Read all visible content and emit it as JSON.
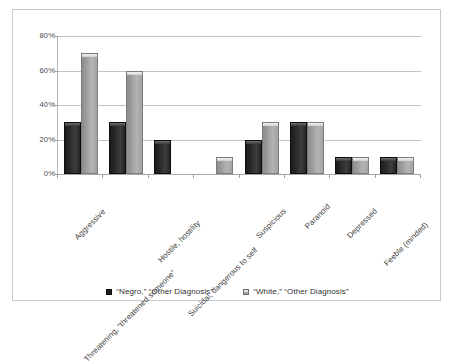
{
  "chart_data": {
    "type": "bar",
    "title": "",
    "subtitle": "",
    "xlabel": "",
    "ylabel": "",
    "ylim": [
      0,
      80
    ],
    "y_tick_labels": [
      "0%",
      "20%",
      "40%",
      "60%",
      "80%"
    ],
    "y_tick_values": [
      0,
      20,
      40,
      60,
      80
    ],
    "grid": true,
    "legend_position": "bottom",
    "categories": [
      "Aggressive",
      "Threatening, “threatened someone”",
      "Hostile, hostility",
      "Suicidal, dangerous to self",
      "Suspicious",
      "Paranoid",
      "Depressed",
      "Feeble (minded)"
    ],
    "series": [
      {
        "name": "“Negro,” “Other Diagnosis”",
        "color": "#1f1f1f",
        "values": [
          30,
          30,
          20,
          0,
          20,
          30,
          10,
          10
        ]
      },
      {
        "name": "“White,” “Other Diagnosis”",
        "color": "#a6a6a6",
        "values": [
          70,
          60,
          0,
          10,
          30,
          30,
          10,
          10
        ]
      }
    ]
  },
  "legend": {
    "items": [
      {
        "label": "“Negro,” “Other Diagnosis”",
        "swatch": "dark"
      },
      {
        "label": "“White,” “Other Diagnosis”",
        "swatch": "light"
      }
    ]
  },
  "colors": {
    "series_dark": "#1f1f1f",
    "series_light": "#a6a6a6",
    "gridline": "#c4c4c4",
    "frame_border": "#c9c9c9",
    "axis_text": "#4a4a4a",
    "background": "#ffffff"
  }
}
